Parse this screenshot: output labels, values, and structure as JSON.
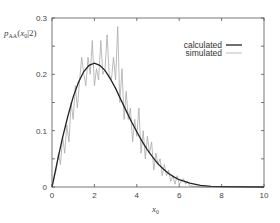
{
  "chart_data": {
    "type": "line",
    "title": "",
    "xlabel": "x_0",
    "ylabel": "p_AA(x_0|2)",
    "xlim": [
      0,
      10
    ],
    "ylim": [
      0,
      0.3
    ],
    "x_ticks": [
      0,
      2,
      4,
      6,
      8,
      10
    ],
    "x_tick_labels": [
      "0",
      "2",
      "4",
      "6",
      "8",
      "10"
    ],
    "y_ticks": [
      0,
      0.05,
      0.1,
      0.15,
      0.2,
      0.25,
      0.3
    ],
    "y_tick_labels": [
      "0",
      "",
      "0.1",
      "",
      "0.2",
      "",
      "0.3"
    ],
    "grid": false,
    "legend_position": "upper right",
    "series": [
      {
        "name": "calculated",
        "color": "#222222",
        "style": "solid-thick",
        "x": [
          0,
          0.25,
          0.5,
          0.75,
          1.0,
          1.25,
          1.5,
          1.75,
          2.0,
          2.25,
          2.5,
          2.75,
          3.0,
          3.25,
          3.5,
          3.75,
          4.0,
          4.25,
          4.5,
          4.75,
          5.0,
          5.25,
          5.5,
          5.75,
          6.0,
          6.5,
          7.0,
          7.5,
          8.0,
          10.0
        ],
        "values": [
          0,
          0.045,
          0.088,
          0.126,
          0.16,
          0.186,
          0.205,
          0.216,
          0.22,
          0.216,
          0.207,
          0.192,
          0.175,
          0.155,
          0.135,
          0.116,
          0.098,
          0.081,
          0.066,
          0.053,
          0.041,
          0.032,
          0.024,
          0.018,
          0.013,
          0.007,
          0.003,
          0.001,
          0.0005,
          0
        ]
      },
      {
        "name": "simulated",
        "color": "#aaaaaa",
        "style": "solid-thin",
        "x": [
          0,
          0.2,
          0.3,
          0.4,
          0.5,
          0.6,
          0.7,
          0.8,
          0.9,
          1.0,
          1.1,
          1.2,
          1.3,
          1.4,
          1.5,
          1.6,
          1.7,
          1.8,
          1.9,
          2.0,
          2.1,
          2.2,
          2.3,
          2.4,
          2.5,
          2.6,
          2.7,
          2.8,
          2.9,
          3.0,
          3.1,
          3.2,
          3.3,
          3.4,
          3.5,
          3.6,
          3.7,
          3.8,
          3.9,
          4.0,
          4.1,
          4.2,
          4.3,
          4.4,
          4.5,
          4.6,
          4.7,
          4.8,
          4.9,
          5.0,
          5.1,
          5.2,
          5.3,
          5.4,
          5.5,
          5.6,
          5.7,
          5.8,
          5.9,
          6.0,
          6.1,
          6.2,
          6.3,
          6.4,
          6.5,
          7.0,
          8.0,
          10.0
        ],
        "values": [
          0,
          0.03,
          0.06,
          0.04,
          0.09,
          0.06,
          0.11,
          0.08,
          0.15,
          0.12,
          0.18,
          0.14,
          0.19,
          0.23,
          0.2,
          0.18,
          0.23,
          0.2,
          0.26,
          0.18,
          0.21,
          0.19,
          0.26,
          0.2,
          0.21,
          0.27,
          0.2,
          0.19,
          0.23,
          0.19,
          0.285,
          0.15,
          0.21,
          0.12,
          0.17,
          0.12,
          0.14,
          0.08,
          0.12,
          0.09,
          0.14,
          0.06,
          0.1,
          0.05,
          0.09,
          0.06,
          0.08,
          0.03,
          0.06,
          0.04,
          0.05,
          0.02,
          0.04,
          0.02,
          0.03,
          0.01,
          0.02,
          0.005,
          0.02,
          0.005,
          0.01,
          0.015,
          0.005,
          0.01,
          0.002,
          0,
          0,
          0
        ]
      }
    ]
  },
  "legend": {
    "items": [
      {
        "label": "calculated"
      },
      {
        "label": "simulated"
      }
    ]
  },
  "axes": {
    "ylabel_main": "p",
    "ylabel_sub": "AA",
    "ylabel_args": "(x",
    "ylabel_args_sub": "0",
    "ylabel_args_tail": "|2)",
    "xlabel_main": "x",
    "xlabel_sub": "0"
  }
}
